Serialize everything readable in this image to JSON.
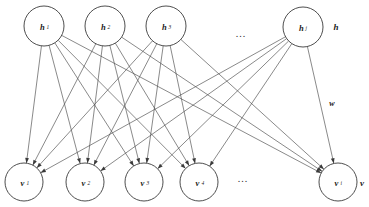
{
  "diagram": {
    "type": "bipartite-graph",
    "background_color": "#ffffff",
    "line_color": "#4a4a4a",
    "node_stroke_color": "#3a3a3a",
    "hidden_layer_label": "h",
    "visible_layer_label": "v",
    "weight_label": "w",
    "hidden_ellipsis": "...",
    "visible_ellipsis": "...",
    "hidden_nodes": [
      {
        "id": "h1",
        "base": "h",
        "sub": "1",
        "cx": 44,
        "cy": 26,
        "r": 20
      },
      {
        "id": "h2",
        "base": "h",
        "sub": "2",
        "cx": 105,
        "cy": 26,
        "r": 20
      },
      {
        "id": "h3",
        "base": "h",
        "sub": "3",
        "cx": 166,
        "cy": 26,
        "r": 20
      },
      {
        "id": "hj",
        "base": "h",
        "sub": "j",
        "cx": 303,
        "cy": 27,
        "r": 20
      }
    ],
    "visible_nodes": [
      {
        "id": "v1",
        "base": "v",
        "sub": "1",
        "cx": 24,
        "cy": 182,
        "r": 19
      },
      {
        "id": "v2",
        "base": "v",
        "sub": "2",
        "cx": 85,
        "cy": 182,
        "r": 19
      },
      {
        "id": "v3",
        "base": "v",
        "sub": "3",
        "cx": 144,
        "cy": 182,
        "r": 19
      },
      {
        "id": "v4",
        "base": "v",
        "sub": "4",
        "cx": 199,
        "cy": 182,
        "r": 19
      },
      {
        "id": "vi",
        "base": "v",
        "sub": "i",
        "cx": 338,
        "cy": 182,
        "r": 19
      }
    ],
    "edges": [
      {
        "from": "h1",
        "to": "v1"
      },
      {
        "from": "h1",
        "to": "v2"
      },
      {
        "from": "h1",
        "to": "v3"
      },
      {
        "from": "h1",
        "to": "v4"
      },
      {
        "from": "h1",
        "to": "vi"
      },
      {
        "from": "h2",
        "to": "v1"
      },
      {
        "from": "h2",
        "to": "v2"
      },
      {
        "from": "h2",
        "to": "v3"
      },
      {
        "from": "h2",
        "to": "v4"
      },
      {
        "from": "h2",
        "to": "vi"
      },
      {
        "from": "h3",
        "to": "v1"
      },
      {
        "from": "h3",
        "to": "v2"
      },
      {
        "from": "h3",
        "to": "v3"
      },
      {
        "from": "h3",
        "to": "v4"
      },
      {
        "from": "h3",
        "to": "vi"
      },
      {
        "from": "hj",
        "to": "v1"
      },
      {
        "from": "hj",
        "to": "v2"
      },
      {
        "from": "hj",
        "to": "v3"
      },
      {
        "from": "hj",
        "to": "v4"
      },
      {
        "from": "hj",
        "to": "vi"
      }
    ],
    "annotations": {
      "hidden_layer_label_pos": {
        "x": 336,
        "y": 27
      },
      "visible_layer_label_pos": {
        "x": 362,
        "y": 183
      },
      "weight_label_pos": {
        "x": 332,
        "y": 103
      },
      "hidden_ellipsis_pos": {
        "x": 241,
        "y": 33
      },
      "visible_ellipsis_pos": {
        "x": 243,
        "y": 178
      }
    }
  }
}
